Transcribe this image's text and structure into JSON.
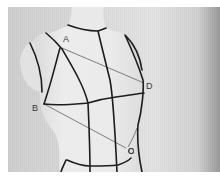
{
  "image": {
    "subject": "Dress form with style tape lines",
    "labels": [
      {
        "id": "A",
        "text": "A",
        "x": 63,
        "y": 42
      },
      {
        "id": "B",
        "text": "B",
        "x": 32,
        "y": 111
      },
      {
        "id": "C",
        "text": "C",
        "x": 128,
        "y": 154
      },
      {
        "id": "D",
        "text": "D",
        "x": 146,
        "y": 89
      }
    ],
    "colors": {
      "background": "#ffffff",
      "wall": "#dcdcdc",
      "form": "#e6e6e6",
      "tape": "#1e1e1e",
      "guide_line": "#6a6a6a"
    }
  }
}
